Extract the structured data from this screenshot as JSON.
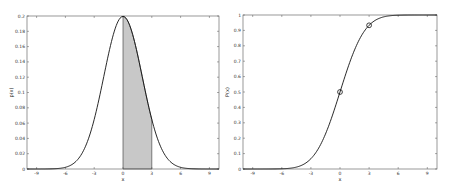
{
  "chart_data": [
    {
      "type": "area",
      "title": "",
      "xlabel": "x",
      "ylabel": "p(x)",
      "xlim": [
        -10,
        10
      ],
      "ylim": [
        0,
        0.2
      ],
      "xticks": [
        -9,
        -6,
        -3,
        0,
        3,
        6,
        9
      ],
      "yticks": [
        0,
        0.02,
        0.04,
        0.06,
        0.08,
        0.1,
        0.12,
        0.14,
        0.16,
        0.18,
        0.2
      ],
      "ytick_labels": [
        "0",
        "0.02",
        "0.04",
        "0.06",
        "0.08",
        "0.1",
        "0.12",
        "0.14",
        "0.16",
        "0.18",
        "0.2"
      ],
      "grid": false,
      "series": [
        {
          "name": "normal pdf",
          "distribution": "normal",
          "mean": 0,
          "std": 2,
          "color": "#111111"
        }
      ],
      "shaded_region": {
        "x_from": 0,
        "x_to": 3,
        "color": "#c8c8c8"
      },
      "frame": {
        "left": 27,
        "top": 16,
        "right": 219,
        "bottom": 169
      }
    },
    {
      "type": "line",
      "title": "",
      "xlabel": "x",
      "ylabel": "P(x)",
      "xlim": [
        -10,
        10
      ],
      "ylim": [
        0,
        1
      ],
      "xticks": [
        -9,
        -6,
        -3,
        0,
        3,
        6,
        9
      ],
      "yticks": [
        0,
        0.1,
        0.2,
        0.3,
        0.4,
        0.5,
        0.6,
        0.7,
        0.8,
        0.9,
        1
      ],
      "ytick_labels": [
        "0",
        "0.1",
        "0.2",
        "0.3",
        "0.4",
        "0.5",
        "0.6",
        "0.7",
        "0.8",
        "0.9",
        "1"
      ],
      "grid": false,
      "series": [
        {
          "name": "normal cdf",
          "distribution": "normal",
          "mean": 0,
          "std": 2,
          "color": "#111111"
        }
      ],
      "markers": [
        {
          "x": 0,
          "y": 0.5,
          "shape": "circle"
        },
        {
          "x": 3,
          "y": 0.933,
          "shape": "circle"
        }
      ],
      "frame": {
        "left": 243,
        "top": 15,
        "right": 437,
        "bottom": 169
      }
    }
  ]
}
